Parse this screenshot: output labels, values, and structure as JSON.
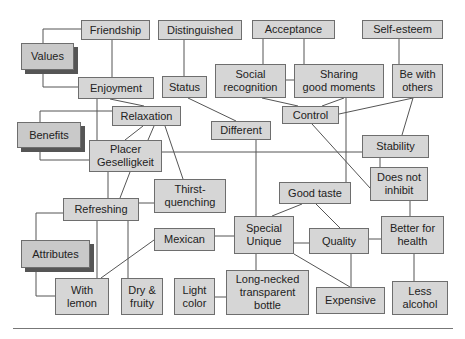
{
  "diagram": {
    "type": "means-end-chain",
    "categories": {
      "values": "Values",
      "benefits": "Benefits",
      "attributes": "Attributes"
    },
    "nodes": {
      "friendship": "Friendship",
      "distinguished": "Distinguished",
      "acceptance": "Acceptance",
      "self_esteem": "Self-esteem",
      "enjoyment": "Enjoyment",
      "status": "Status",
      "social_recognition": "Social\nrecognition",
      "sharing_good_moments": "Sharing\ngood moments",
      "be_with_others": "Be with\nothers",
      "relaxation": "Relaxation",
      "control": "Control",
      "different": "Different",
      "placer_geselligkeit": "Placer\nGeselligkeit",
      "stability": "Stability",
      "thirst_quenching": "Thirst-\nquenching",
      "does_not_inhibit": "Does not\ninhibit",
      "refreshing": "Refreshing",
      "good_taste": "Good taste",
      "mexican": "Mexican",
      "special_unique": "Special\nUnique",
      "quality": "Quality",
      "better_for_health": "Better for\nhealth",
      "with_lemon": "With\nlemon",
      "dry_fruity": "Dry &\nfruity",
      "light_color": "Light\ncolor",
      "long_necked_bottle": "Long-necked\ntransparent\nbottle",
      "expensive": "Expensive",
      "less_alcohol": "Less\nalcohol"
    },
    "colors": {
      "node_fill": "#d6d6d6",
      "category_fill": "#c9c9c9",
      "border": "#6e6e6e",
      "line": "#555555"
    }
  }
}
